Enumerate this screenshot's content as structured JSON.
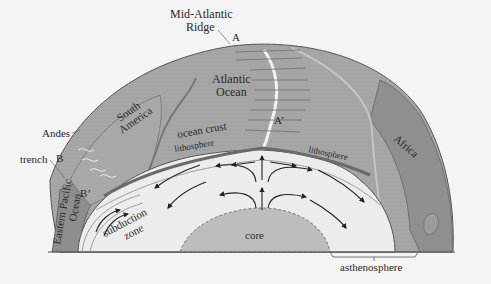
{
  "diagram": {
    "colors": {
      "background": "#f4f4f4",
      "crust_plate": "#a3a3a3",
      "continent_dark": "#8a8a8a",
      "mantle": "#ececec",
      "asthenosphere_band": "#e2e2e2",
      "core": "#bdbdbd",
      "ridge_highlight": "#f0f0f0",
      "arrow": "#222222",
      "outline": "#555555"
    },
    "labels": {
      "mid_atlantic_ridge_line1": "Mid-Atlantic",
      "mid_atlantic_ridge_line2": "Ridge",
      "point_a": "A",
      "point_a_prime": "A’",
      "atlantic_ocean_line1": "Atlantic",
      "atlantic_ocean_line2": "Ocean",
      "south_america_line1": "South",
      "south_america_line2": "America",
      "africa": "Africa",
      "andes": "Andes",
      "trench": "trench",
      "point_b": "B",
      "point_b_prime": "B’",
      "eastern_pacific_line1": "Eastern Pacific",
      "eastern_pacific_line2": "Ocean",
      "ocean_crust": "ocean crust",
      "lithosphere_left": "lithosphere",
      "lithosphere_right": "lithosphere",
      "subduction_line1": "subduction",
      "subduction_line2": "zone",
      "core": "core",
      "asthenosphere": "asthenosphere"
    },
    "arrows": {
      "count_convection": 12,
      "rising_center": 2
    }
  }
}
